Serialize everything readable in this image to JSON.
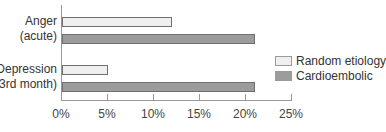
{
  "chart_data": {
    "type": "bar",
    "orientation": "horizontal",
    "title": "",
    "xlabel": "",
    "ylabel": "",
    "categories": [
      "Anger (acute)",
      "Depression (3rd month)"
    ],
    "category_lines": [
      [
        "Anger",
        "(acute)"
      ],
      [
        "Depression",
        "(3rd month)"
      ]
    ],
    "series": [
      {
        "name": "Random etiology",
        "color": "#efefef",
        "values": [
          12,
          5
        ]
      },
      {
        "name": "Cardioembolic",
        "color": "#9c9c9c",
        "values": [
          21,
          21
        ]
      }
    ],
    "xlim": [
      0,
      25
    ],
    "xticks": [
      0,
      5,
      10,
      15,
      20,
      25
    ],
    "xtick_labels": [
      "0%",
      "5%",
      "10%",
      "15%",
      "20%",
      "25%"
    ],
    "grid": false,
    "legend_position": "right"
  },
  "legend": {
    "items": [
      {
        "label": "Random etiology",
        "color": "#efefef"
      },
      {
        "label": "Cardioembolic",
        "color": "#9c9c9c"
      }
    ]
  }
}
